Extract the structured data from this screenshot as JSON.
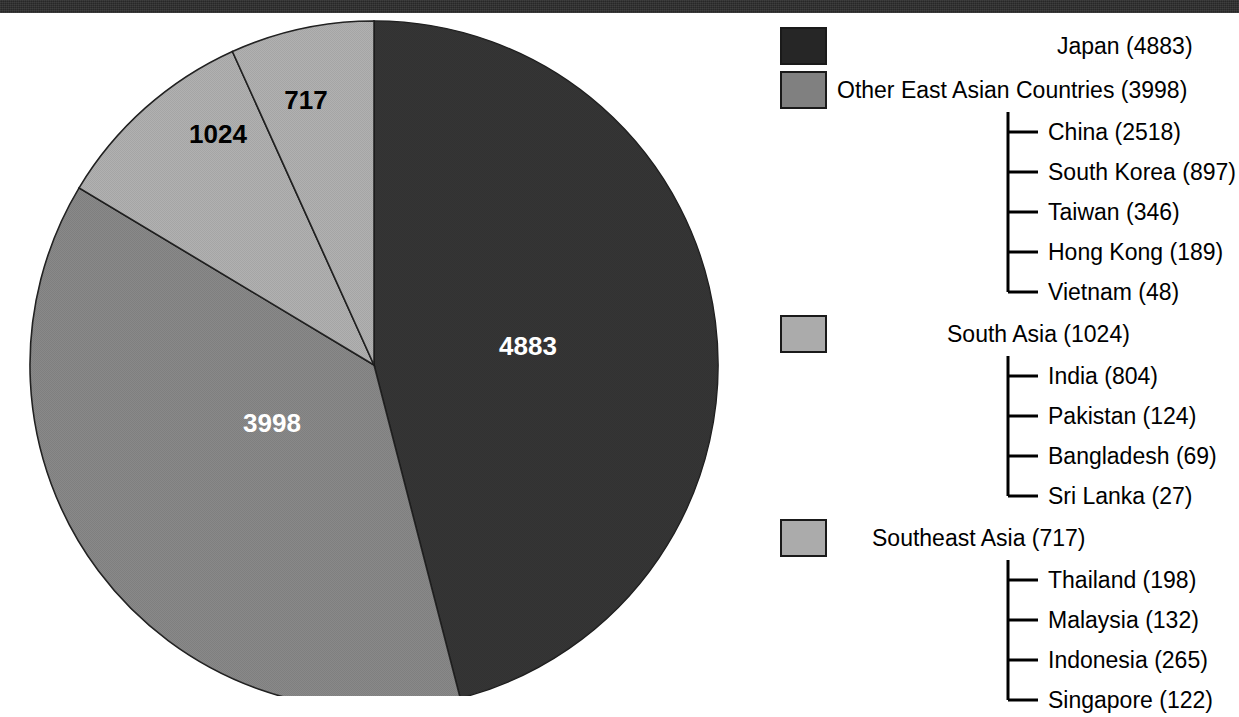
{
  "chart_data": {
    "type": "pie",
    "title": "",
    "total": 10622,
    "categories": [
      "Japan",
      "Other East Asian Countries",
      "South Asia",
      "Southeast Asia"
    ],
    "values": [
      4883,
      3998,
      1024,
      717
    ],
    "slice_labels": [
      "4883",
      "3998",
      "1024",
      "717"
    ],
    "colors": [
      "#262626",
      "#808080",
      "#ababab",
      "#ababab"
    ],
    "label_colors": [
      "#ffffff",
      "#ffffff",
      "#000000",
      "#000000"
    ],
    "legend_position": "right",
    "grid": false,
    "breakdown": {
      "Other East Asian Countries": [
        {
          "name": "China",
          "value": 2518
        },
        {
          "name": "South Korea",
          "value": 897
        },
        {
          "name": "Taiwan",
          "value": 346
        },
        {
          "name": "Hong Kong",
          "value": 189
        },
        {
          "name": "Vietnam",
          "value": 48
        }
      ],
      "South Asia": [
        {
          "name": "India",
          "value": 804
        },
        {
          "name": "Pakistan",
          "value": 124
        },
        {
          "name": "Bangladesh",
          "value": 69
        },
        {
          "name": "Sri Lanka",
          "value": 27
        }
      ],
      "Southeast Asia": [
        {
          "name": "Thailand",
          "value": 198
        },
        {
          "name": "Malaysia",
          "value": 132
        },
        {
          "name": "Indonesia",
          "value": 265
        },
        {
          "name": "Singapore",
          "value": 122
        }
      ]
    }
  },
  "pie": {
    "slices": [
      {
        "label": "4883",
        "label_x": 528,
        "label_y": 355
      },
      {
        "label": "3998",
        "label_x": 272,
        "label_y": 432
      },
      {
        "label": "1024",
        "label_x": 218,
        "label_y": 143
      },
      {
        "label": "717",
        "label_x": 306,
        "label_y": 109
      }
    ]
  },
  "legend": {
    "groups": [
      {
        "label": "Japan (4883)",
        "swatch_color": "#262626",
        "children": []
      },
      {
        "label": "Other East Asian Countries (3998)",
        "swatch_color": "#808080",
        "children": [
          "China (2518)",
          "South Korea (897)",
          "Taiwan (346)",
          "Hong Kong (189)",
          "Vietnam (48)"
        ]
      },
      {
        "label": "South Asia (1024)",
        "swatch_color": "#ababab",
        "children": [
          "India (804)",
          "Pakistan (124)",
          "Bangladesh (69)",
          "Sri Lanka (27)"
        ]
      },
      {
        "label": "Southeast Asia (717)",
        "swatch_color": "#ababab",
        "children": [
          "Thailand (198)",
          "Malaysia (132)",
          "Indonesia (265)",
          "Singapore (122)"
        ]
      }
    ]
  }
}
